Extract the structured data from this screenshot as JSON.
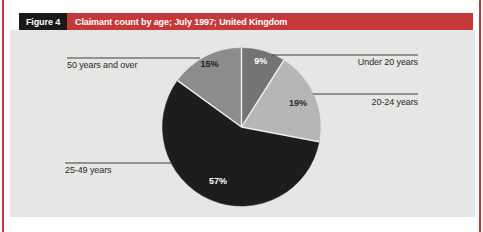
{
  "header": {
    "figure_label": "Figure 4",
    "title": "Claimant count by age; July 1997; United Kingdom"
  },
  "colors": {
    "accent_red": "#c5393b",
    "figure_box_bg": "#1a1a1a",
    "chart_bg": "#e6e6e4",
    "leader_line": "#3c3c3c",
    "divider": "#f2f2f2",
    "label_text": "#2b2b2b"
  },
  "chart_data": {
    "type": "pie",
    "title": "Claimant count by age; July 1997; United Kingdom",
    "categories": [
      "Under 20 years",
      "20-24 years",
      "25-49 years",
      "50 years and over"
    ],
    "values": [
      9,
      19,
      57,
      15
    ],
    "pct_labels": [
      "9%",
      "19%",
      "57%",
      "15%"
    ],
    "unit": "percent",
    "start_angle_deg": 0,
    "direction": "clockwise",
    "slice_colors": [
      "#747474",
      "#b6b6b6",
      "#1d1d1d",
      "#8c8c8c"
    ],
    "pct_label_colors": [
      "#ffffff",
      "#2b2b2b",
      "#ffffff",
      "#1d1d1d"
    ],
    "legend": "none",
    "label_style": "callout-lines"
  }
}
